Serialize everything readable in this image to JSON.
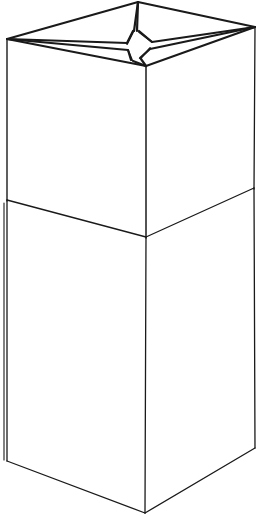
{
  "figure": {
    "title": "Open cardboard box line drawing",
    "view": "three-quarter perspective",
    "style": "black ink line art on white background",
    "background_color": "#ffffff",
    "stroke_color": "#1a1a1a",
    "canvas": {
      "width": 261,
      "height": 516
    }
  },
  "geometry": {
    "points": {
      "rim_left": [
        7,
        39
      ],
      "rim_back": [
        138,
        2
      ],
      "rim_right": [
        255,
        27
      ],
      "rim_front": [
        146,
        66
      ],
      "flap_center": [
        135,
        46
      ],
      "flap_inner_left": [
        120,
        48
      ],
      "flap_inner_back": [
        134,
        30
      ],
      "flap_inner_right": [
        152,
        44
      ],
      "flap_inner_front": [
        137,
        60
      ],
      "mid_left": [
        7,
        200
      ],
      "mid_front": [
        146,
        237
      ],
      "mid_right": [
        254,
        188
      ],
      "bottom_left": [
        7,
        461
      ],
      "bottom_front": [
        145,
        513
      ],
      "bottom_right": [
        255,
        448
      ]
    },
    "edges": [
      {
        "name": "rim-back-left",
        "from": "rim_left",
        "to": "rim_back"
      },
      {
        "name": "rim-back-right",
        "from": "rim_back",
        "to": "rim_right"
      },
      {
        "name": "rim-front-right",
        "from": "rim_right",
        "to": "rim_front"
      },
      {
        "name": "rim-front-left",
        "from": "rim_front",
        "to": "rim_left"
      },
      {
        "name": "flap-fold-left",
        "from": "rim_left",
        "to": "flap_center"
      },
      {
        "name": "flap-fold-back",
        "from": "rim_back",
        "to": "flap_center"
      },
      {
        "name": "flap-fold-right",
        "from": "rim_right",
        "to": "flap_center"
      },
      {
        "name": "flap-fold-front",
        "from": "rim_front",
        "to": "flap_center"
      },
      {
        "name": "upper-edge-left",
        "from": "rim_left",
        "to": "mid_left"
      },
      {
        "name": "upper-edge-front",
        "from": "rim_front",
        "to": "mid_front"
      },
      {
        "name": "upper-edge-right",
        "from": "rim_right",
        "to": "mid_right"
      },
      {
        "name": "seam-left",
        "from": "mid_left",
        "to": "mid_front"
      },
      {
        "name": "seam-right",
        "from": "mid_front",
        "to": "mid_right"
      },
      {
        "name": "lower-edge-left",
        "from": "mid_left",
        "to": "bottom_left"
      },
      {
        "name": "lower-edge-front",
        "from": "mid_front",
        "to": "bottom_front"
      },
      {
        "name": "lower-edge-right",
        "from": "mid_right",
        "to": "bottom_right"
      },
      {
        "name": "base-left",
        "from": "bottom_left",
        "to": "bottom_front"
      },
      {
        "name": "base-right",
        "from": "bottom_front",
        "to": "bottom_right"
      }
    ],
    "stroke_widths": {
      "rim": 2.0,
      "flap": 2.4,
      "body": 1.3,
      "seam": 1.3,
      "base": 1.3
    }
  },
  "paths": {
    "rim_outline": "M 7 39 L 138 2 L 255 27 L 146 66 Z",
    "star_left_upper": "M 7 39 L 128 43 L 134 31 L 138 2",
    "star_left_lower": "M 7 39 L 129 50 L 132 59 L 146 66",
    "star_right_upper": "M 255 27 L 151 41 L 135 31 L 138 2",
    "star_right_lower": "M 255 27 L 148 50 L 139 60 L 146 66",
    "flap_cross": "M 120 47 L 133 29 M 136 30 L 152 43 M 153 46 L 140 59 M 137 61 L 121 50",
    "upper_left_panel": "M 7 39 L 146 66 L 146 237 L 7 200 Z",
    "upper_right_panel": "M 146 66 L 255 27 L 254 188 L 146 237 Z",
    "lower_left_panel": "M 7 200 L 146 237 L 145 513 L 7 461 Z",
    "lower_right_panel": "M 146 237 L 254 188 L 255 448 L 145 513 Z",
    "mid_step_left": "M 4 202 L 4 461"
  },
  "labels": {
    "none_visible": ""
  }
}
